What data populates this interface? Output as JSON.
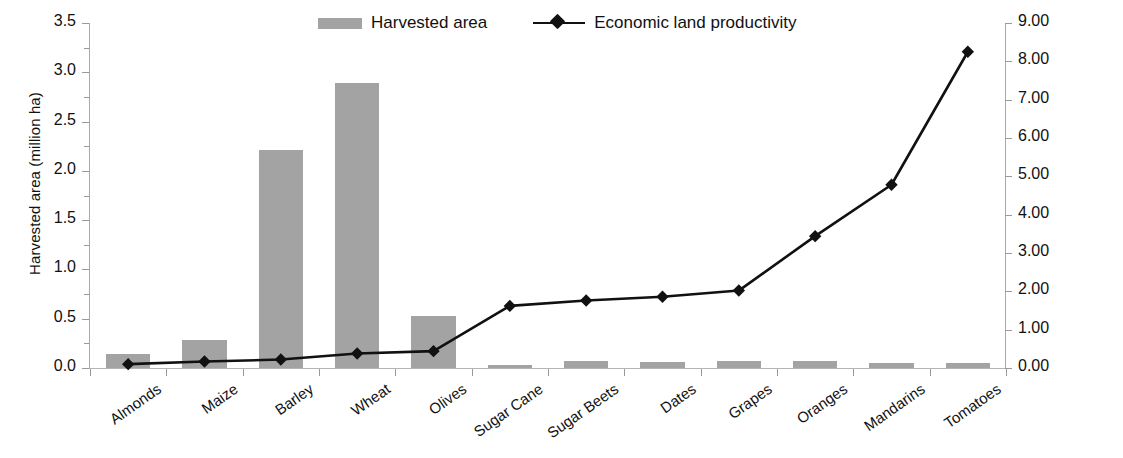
{
  "chart_data": {
    "type": "bar",
    "title": "",
    "subtitle": "",
    "xlabel": "",
    "ylabel": "Harvested area (million ha)",
    "y2label": "Economic land productivity (1000 US$/ha)",
    "grid": false,
    "legend_position": "top-center",
    "categories": [
      "Almonds",
      "Maize",
      "Barley",
      "Wheat",
      "Olives",
      "Sugar Cane",
      "Sugar Beets",
      "Dates",
      "Grapes",
      "Oranges",
      "Mandarins",
      "Tomatoes"
    ],
    "ylim": [
      0,
      3.5
    ],
    "y2lim": [
      0,
      9
    ],
    "yticks": [
      "0.0",
      "0.5",
      "1.0",
      "1.5",
      "2.0",
      "2.5",
      "3.0",
      "3.5"
    ],
    "ytick_values": [
      0,
      0.5,
      1.0,
      1.5,
      2.0,
      2.5,
      3.0,
      3.5
    ],
    "y2ticks": [
      "0.00",
      "1.00",
      "2.00",
      "3.00",
      "4.00",
      "5.00",
      "6.00",
      "7.00",
      "8.00",
      "9.00"
    ],
    "y2tick_values": [
      0,
      1,
      2,
      3,
      4,
      5,
      6,
      7,
      8,
      9
    ],
    "series": [
      {
        "name": "Harvested area",
        "type": "bar",
        "axis": "left",
        "color": "#a3a3a3",
        "values": [
          0.14,
          0.28,
          2.21,
          2.89,
          0.53,
          0.03,
          0.07,
          0.06,
          0.07,
          0.07,
          0.05,
          0.05
        ]
      },
      {
        "name": "Economic land productivity",
        "type": "line",
        "axis": "right",
        "color": "#111111",
        "marker": "diamond",
        "values": [
          0.1,
          0.17,
          0.22,
          0.38,
          0.44,
          1.62,
          1.76,
          1.86,
          2.02,
          3.44,
          4.78,
          8.25
        ]
      }
    ]
  },
  "legend": {
    "items": [
      {
        "label": "Harvested area",
        "marker": "bar-swatch"
      },
      {
        "label": "Economic land productivity",
        "marker": "line-diamond"
      }
    ]
  }
}
